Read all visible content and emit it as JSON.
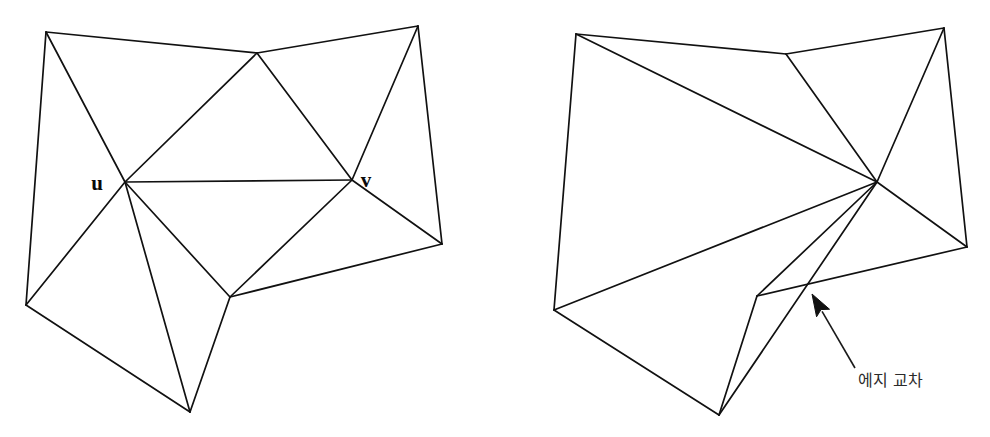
{
  "figure": {
    "background_color": "#ffffff",
    "line_color": "#111111",
    "label_color": "#0a0a0a",
    "annotation_color": "#2b2b2b",
    "width": 990,
    "height": 437
  },
  "left_diagram": {
    "name": "planar-triangulation",
    "vertex_labels": {
      "u": "u",
      "v": "v"
    },
    "label_positions": {
      "u": {
        "x": 97,
        "y": 190
      },
      "v": {
        "x": 366,
        "y": 187
      }
    },
    "vertices": {
      "top_left": {
        "x": 46,
        "y": 32
      },
      "top_mid": {
        "x": 257,
        "y": 53
      },
      "top_right": {
        "x": 418,
        "y": 26
      },
      "u": {
        "x": 125,
        "y": 182
      },
      "v": {
        "x": 352,
        "y": 180
      },
      "right": {
        "x": 442,
        "y": 244
      },
      "bottom_left": {
        "x": 26,
        "y": 305
      },
      "center_bottom": {
        "x": 230,
        "y": 297
      },
      "bottom": {
        "x": 190,
        "y": 412
      }
    },
    "edges": [
      [
        "top_left",
        "top_mid"
      ],
      [
        "top_mid",
        "top_right"
      ],
      [
        "top_left",
        "u"
      ],
      [
        "top_left",
        "bottom_left"
      ],
      [
        "top_mid",
        "u"
      ],
      [
        "top_mid",
        "v"
      ],
      [
        "top_right",
        "v"
      ],
      [
        "top_right",
        "right"
      ],
      [
        "u",
        "v"
      ],
      [
        "u",
        "bottom_left"
      ],
      [
        "u",
        "center_bottom"
      ],
      [
        "u",
        "bottom"
      ],
      [
        "v",
        "center_bottom"
      ],
      [
        "v",
        "right"
      ],
      [
        "right",
        "center_bottom"
      ],
      [
        "bottom_left",
        "bottom"
      ],
      [
        "bottom",
        "center_bottom"
      ]
    ]
  },
  "right_diagram": {
    "name": "non-planar-triangulation-with-crossing",
    "vertices": {
      "top_left": {
        "x": 576,
        "y": 34
      },
      "top_mid": {
        "x": 786,
        "y": 54
      },
      "top_right": {
        "x": 944,
        "y": 28
      },
      "hub": {
        "x": 877,
        "y": 182
      },
      "right": {
        "x": 967,
        "y": 247
      },
      "bottom_left": {
        "x": 554,
        "y": 310
      },
      "notch": {
        "x": 757,
        "y": 296
      },
      "bottom": {
        "x": 719,
        "y": 415
      }
    },
    "edges": [
      [
        "top_left",
        "top_mid"
      ],
      [
        "top_mid",
        "top_right"
      ],
      [
        "top_left",
        "bottom_left"
      ],
      [
        "top_left",
        "hub"
      ],
      [
        "top_mid",
        "hub"
      ],
      [
        "top_right",
        "hub"
      ],
      [
        "top_right",
        "right"
      ],
      [
        "hub",
        "right"
      ],
      [
        "hub",
        "bottom_left"
      ],
      [
        "hub",
        "notch"
      ],
      [
        "hub",
        "bottom"
      ],
      [
        "right",
        "notch"
      ],
      [
        "bottom_left",
        "bottom"
      ],
      [
        "bottom",
        "notch"
      ]
    ],
    "crossing_point": {
      "x": 805,
      "y": 288
    }
  },
  "annotation": {
    "label": "에지 교차",
    "label_position": {
      "x": 858,
      "y": 386
    },
    "arrow_tail": {
      "x": 855,
      "y": 368
    },
    "arrow_tip": {
      "x": 812,
      "y": 294
    }
  }
}
